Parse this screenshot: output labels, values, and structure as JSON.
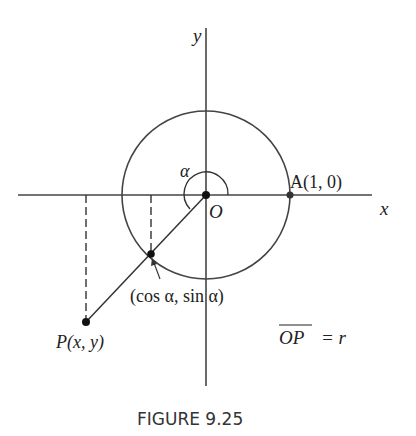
{
  "figure": {
    "caption": "FIGURE 9.25",
    "axes": {
      "x_label": "x",
      "y_label": "y"
    },
    "labels": {
      "origin": "O",
      "angle": "α",
      "point_A": "A(1, 0)",
      "point_P": "P(x, y)",
      "unit_point": "(cos α, sin α)",
      "op_lhs": "OP",
      "op_rhs": "= r"
    }
  }
}
